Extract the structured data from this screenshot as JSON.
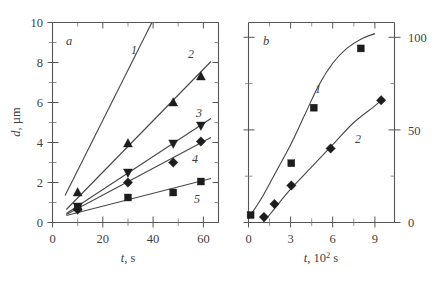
{
  "figure": {
    "background": "#ffffff",
    "line_color": "#4a4a4a",
    "marker_color": "#1d1d1d",
    "text_color": "#3f3f3f"
  },
  "panel_a": {
    "label": "a",
    "xlabel_symbol": "t",
    "xlabel_unit": ", s",
    "ylabel_symbol": "d",
    "ylabel_unit": ", µm",
    "xticks": [
      "0",
      "20",
      "40",
      "60"
    ],
    "yticks": [
      "0",
      "2",
      "4",
      "6",
      "8",
      "10"
    ],
    "curve_labels": [
      "1",
      "2",
      "3",
      "4",
      "5"
    ]
  },
  "panel_b": {
    "label": "b",
    "xlabel_symbol": "t",
    "xlabel_unit": ", 10",
    "xlabel_exp": "2",
    "xlabel_unit2": " s",
    "xticks": [
      "0",
      "3",
      "6",
      "9"
    ],
    "yticks": [
      "0",
      "50",
      "100"
    ],
    "curve_labels": [
      "1",
      "2"
    ]
  },
  "chart_data": [
    {
      "type": "line",
      "panel": "a",
      "title": "a",
      "xlabel": "t, s",
      "ylabel": "d, µm",
      "xlim": [
        0,
        66
      ],
      "ylim": [
        0,
        10
      ],
      "xticks": [
        0,
        20,
        40,
        60
      ],
      "yticks": [
        0,
        2,
        4,
        6,
        8,
        10
      ],
      "minor_xticks": [
        10,
        30,
        50
      ],
      "minor_yticks": [
        1,
        3,
        5,
        7,
        9
      ],
      "grid": false,
      "legend": "inline-curve-numbers",
      "series": [
        {
          "name": "1",
          "marker": "none",
          "fit_line": {
            "x": [
              5.0,
              39.5
            ],
            "y": [
              1.35,
              10.0
            ]
          },
          "points": []
        },
        {
          "name": "2",
          "marker": "triangle-up",
          "fit_line": {
            "x": [
              5.5,
              63.0
            ],
            "y": [
              0.65,
              8.05
            ]
          },
          "points": [
            {
              "x": 10,
              "y": 1.5
            },
            {
              "x": 30,
              "y": 3.95
            },
            {
              "x": 48,
              "y": 6.0
            },
            {
              "x": 59,
              "y": 7.3
            }
          ]
        },
        {
          "name": "3",
          "marker": "triangle-down",
          "fit_line": {
            "x": [
              5.5,
              63.0
            ],
            "y": [
              0.45,
              5.2
            ]
          },
          "points": [
            {
              "x": 10,
              "y": 0.8
            },
            {
              "x": 30,
              "y": 2.5
            },
            {
              "x": 48,
              "y": 3.95
            },
            {
              "x": 59,
              "y": 4.85
            }
          ]
        },
        {
          "name": "4",
          "marker": "diamond",
          "fit_line": {
            "x": [
              5.5,
              63.0
            ],
            "y": [
              0.4,
              4.25
            ]
          },
          "points": [
            {
              "x": 10,
              "y": 0.65
            },
            {
              "x": 30,
              "y": 2.0
            },
            {
              "x": 48,
              "y": 3.0
            },
            {
              "x": 59,
              "y": 4.05
            }
          ]
        },
        {
          "name": "5",
          "marker": "square",
          "fit_line": {
            "x": [
              5.5,
              63.0
            ],
            "y": [
              0.35,
              2.2
            ]
          },
          "points": [
            {
              "x": 10,
              "y": 0.75
            },
            {
              "x": 30,
              "y": 1.25
            },
            {
              "x": 48,
              "y": 1.5
            },
            {
              "x": 59,
              "y": 2.05
            }
          ]
        }
      ]
    },
    {
      "type": "line",
      "panel": "b",
      "title": "b",
      "xlabel": "t, 10^2 s",
      "ylabel": "",
      "xlim": [
        0,
        10.4
      ],
      "ylim": [
        0,
        108
      ],
      "xticks": [
        0,
        3,
        6,
        9
      ],
      "yticks": [
        0,
        50,
        100
      ],
      "minor_xticks": [
        1.5,
        4.5,
        7.5
      ],
      "minor_yticks": [
        12.5,
        25,
        37.5,
        62.5,
        75,
        87.5
      ],
      "grid": false,
      "legend": "inline-curve-numbers",
      "series": [
        {
          "name": "1",
          "marker": "square",
          "curve_points": [
            {
              "x": 0.15,
              "y": 4
            },
            {
              "x": 1.0,
              "y": 14
            },
            {
              "x": 2.0,
              "y": 28
            },
            {
              "x": 3.0,
              "y": 42
            },
            {
              "x": 4.0,
              "y": 58
            },
            {
              "x": 5.0,
              "y": 74
            },
            {
              "x": 6.0,
              "y": 86
            },
            {
              "x": 7.0,
              "y": 94
            },
            {
              "x": 8.0,
              "y": 99
            },
            {
              "x": 9.0,
              "y": 102
            }
          ],
          "points": [
            {
              "x": 0.15,
              "y": 4
            },
            {
              "x": 3.05,
              "y": 32
            },
            {
              "x": 4.65,
              "y": 62
            },
            {
              "x": 8.0,
              "y": 94
            }
          ]
        },
        {
          "name": "2",
          "marker": "diamond",
          "curve_points": [
            {
              "x": 1.05,
              "y": 0
            },
            {
              "x": 1.8,
              "y": 7
            },
            {
              "x": 3.0,
              "y": 18
            },
            {
              "x": 4.5,
              "y": 30
            },
            {
              "x": 6.0,
              "y": 42
            },
            {
              "x": 7.5,
              "y": 54
            },
            {
              "x": 9.0,
              "y": 63
            },
            {
              "x": 9.6,
              "y": 67
            }
          ],
          "points": [
            {
              "x": 1.1,
              "y": 3
            },
            {
              "x": 1.85,
              "y": 10
            },
            {
              "x": 3.05,
              "y": 20
            },
            {
              "x": 5.85,
              "y": 40
            },
            {
              "x": 9.45,
              "y": 66
            }
          ]
        }
      ]
    }
  ]
}
